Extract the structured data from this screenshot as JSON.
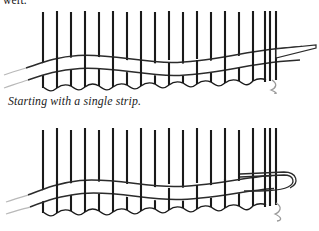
{
  "page": {
    "background_color": "#ffffff",
    "truncated_heading": "weft.",
    "caption": "Starting with a single strip."
  },
  "figures": [
    {
      "name": "figure-single-strip-start",
      "role": "line-illustration",
      "subject": "basket weaving: single weaving strip worked across vertical stakes",
      "stake_color": "#1a1a1a",
      "strip_color": "#2b2b2b",
      "faded_color": "#b9b9b9",
      "stake_count": 16,
      "cluster_stake_count": 3,
      "has_loose_end_squiggle": true,
      "strip_loops_back": false
    },
    {
      "name": "figure-strip-wrapped-back",
      "role": "line-illustration",
      "subject": "basket weaving: weaving strip wrapped around end stake and returning",
      "stake_color": "#1a1a1a",
      "strip_color": "#2b2b2b",
      "faded_color": "#b9b9b9",
      "stake_count": 16,
      "cluster_stake_count": 3,
      "has_loose_end_squiggle": true,
      "strip_loops_back": true
    }
  ]
}
